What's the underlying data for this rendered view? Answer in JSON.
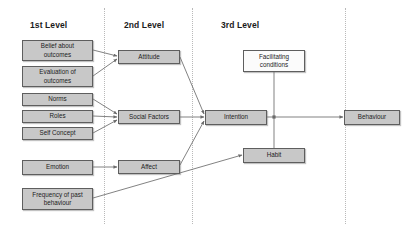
{
  "diagram": {
    "background_color": "#ffffff",
    "shaded_fill": "#c8c8c8",
    "plain_fill": "#fbfbfb",
    "border_color": "#5e5e5e",
    "edge_color": "#6b6b6b",
    "columns": [
      {
        "name": "level-1",
        "label": "1st Level",
        "x": 30,
        "y": 20
      },
      {
        "name": "level-2",
        "label": "2nd Level",
        "x": 124,
        "y": 20
      },
      {
        "name": "level-3",
        "label": "3rd Level",
        "x": 221,
        "y": 20
      }
    ],
    "dividers": [
      104,
      192,
      345
    ],
    "nodes": [
      {
        "id": "belief-about-outcomes",
        "label": "Belief about outcomes",
        "lines": [
          "Belief about",
          "outcomes"
        ],
        "x": 22,
        "y": 40,
        "w": 71,
        "h": 21,
        "fill": "shaded"
      },
      {
        "id": "evaluation-of-outcomes",
        "label": "Evaluation of outcomes",
        "lines": [
          "Evaluation of",
          "outcomes"
        ],
        "x": 22,
        "y": 66,
        "w": 71,
        "h": 21,
        "fill": "shaded"
      },
      {
        "id": "norms",
        "label": "Norms",
        "lines": [
          "Norms"
        ],
        "x": 22,
        "y": 93,
        "w": 71,
        "h": 13,
        "fill": "shaded"
      },
      {
        "id": "roles",
        "label": "Roles",
        "lines": [
          "Roles"
        ],
        "x": 22,
        "y": 110,
        "w": 71,
        "h": 13,
        "fill": "shaded"
      },
      {
        "id": "self-concept",
        "label": "Self Concept",
        "lines": [
          "Self Concept"
        ],
        "x": 22,
        "y": 127,
        "w": 71,
        "h": 13,
        "fill": "shaded"
      },
      {
        "id": "emotion",
        "label": "Emotion",
        "lines": [
          "Emotion"
        ],
        "x": 22,
        "y": 160,
        "w": 71,
        "h": 15,
        "fill": "shaded"
      },
      {
        "id": "frequency-of-past-behaviour",
        "label": "Frequency of past behaviour",
        "lines": [
          "Frequency of past",
          "behaviour"
        ],
        "x": 22,
        "y": 188,
        "w": 71,
        "h": 22,
        "fill": "shaded"
      },
      {
        "id": "attitude",
        "label": "Attitude",
        "lines": [
          "Attitude"
        ],
        "x": 118,
        "y": 50,
        "w": 62,
        "h": 14,
        "fill": "shaded"
      },
      {
        "id": "social-factors",
        "label": "Social Factors",
        "lines": [
          "Social Factors"
        ],
        "x": 118,
        "y": 110,
        "w": 62,
        "h": 14,
        "fill": "shaded"
      },
      {
        "id": "affect",
        "label": "Affect",
        "lines": [
          "Affect"
        ],
        "x": 118,
        "y": 160,
        "w": 62,
        "h": 14,
        "fill": "shaded"
      },
      {
        "id": "facilitating-conditions",
        "label": "Facilitating conditions",
        "lines": [
          "Facilitating",
          "conditions"
        ],
        "x": 243,
        "y": 50,
        "w": 62,
        "h": 22,
        "fill": "plain"
      },
      {
        "id": "intention",
        "label": "Intention",
        "lines": [
          "Intention"
        ],
        "x": 205,
        "y": 110,
        "w": 62,
        "h": 15,
        "fill": "shaded"
      },
      {
        "id": "habit",
        "label": "Habit",
        "lines": [
          "Habit"
        ],
        "x": 243,
        "y": 148,
        "w": 62,
        "h": 15,
        "fill": "shaded"
      },
      {
        "id": "behaviour",
        "label": "Behaviour",
        "lines": [
          "Behaviour"
        ],
        "x": 344,
        "y": 110,
        "w": 56,
        "h": 15,
        "fill": "shaded"
      }
    ],
    "edges": [
      {
        "from": "belief-about-outcomes",
        "to": "attitude",
        "arrow": true
      },
      {
        "from": "evaluation-of-outcomes",
        "to": "attitude",
        "arrow": true
      },
      {
        "from": "norms",
        "to": "social-factors",
        "arrow": true
      },
      {
        "from": "roles",
        "to": "social-factors",
        "arrow": true
      },
      {
        "from": "self-concept",
        "to": "social-factors",
        "arrow": true
      },
      {
        "from": "emotion",
        "to": "affect",
        "arrow": true
      },
      {
        "from": "attitude",
        "to": "intention",
        "arrow": true
      },
      {
        "from": "social-factors",
        "to": "intention",
        "arrow": true
      },
      {
        "from": "affect",
        "to": "intention",
        "arrow": true
      },
      {
        "from": "intention",
        "to": "behaviour",
        "arrow": true
      },
      {
        "from": "facilitating-conditions",
        "to": "behaviour-junction",
        "arrow": false
      },
      {
        "from": "habit",
        "to": "behaviour-junction",
        "arrow": false
      },
      {
        "from": "frequency-of-past-behaviour",
        "to": "habit",
        "arrow": true
      }
    ]
  }
}
